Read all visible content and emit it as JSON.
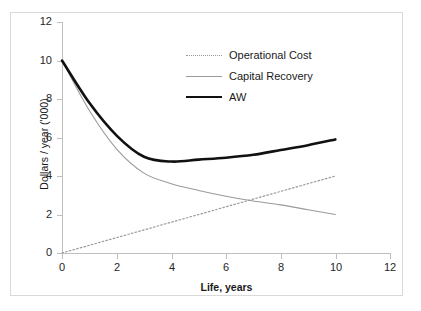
{
  "chart_data": {
    "type": "line",
    "title": "",
    "xlabel": "Life, years",
    "ylabel": "Dollars / year ('000)",
    "xlim": [
      0,
      12
    ],
    "ylim": [
      0,
      12
    ],
    "xticks": [
      "0",
      "2",
      "4",
      "6",
      "8",
      "10",
      "12"
    ],
    "yticks": [
      "0",
      "2",
      "4",
      "6",
      "8",
      "10",
      "12"
    ],
    "grid": false,
    "legend_position": "upper-center",
    "x": [
      0,
      1,
      2,
      3,
      4,
      5,
      6,
      7,
      8,
      9,
      10
    ],
    "series": [
      {
        "name": "Operational Cost",
        "style": "dotted",
        "color": "#9a9a9a",
        "values": [
          0.0,
          0.4,
          0.8,
          1.2,
          1.6,
          2.0,
          2.4,
          2.8,
          3.2,
          3.6,
          4.0
        ]
      },
      {
        "name": "Capital Recovery",
        "style": "thin",
        "color": "#9a9a9a",
        "values": [
          10.0,
          7.4,
          5.4,
          4.15,
          3.6,
          3.25,
          2.95,
          2.7,
          2.5,
          2.25,
          2.0
        ]
      },
      {
        "name": "AW",
        "style": "thick",
        "color": "#111111",
        "values": [
          10.0,
          7.8,
          6.1,
          5.0,
          4.75,
          4.85,
          4.95,
          5.1,
          5.35,
          5.6,
          5.9
        ]
      }
    ]
  },
  "legend": {
    "items": [
      {
        "label": "Operational Cost"
      },
      {
        "label": "Capital Recovery"
      },
      {
        "label": "AW"
      }
    ]
  },
  "axes": {
    "x_title": "Life, years",
    "y_title": "Dollars / year ('000)",
    "x_tick_labels": [
      "0",
      "2",
      "4",
      "6",
      "8",
      "10",
      "12"
    ],
    "y_tick_labels": [
      "0",
      "2",
      "4",
      "6",
      "8",
      "10",
      "12"
    ]
  },
  "colors": {
    "axis": "#bfbfbf",
    "frame": "#d9d9d9",
    "series_gray": "#9a9a9a",
    "series_black": "#111111",
    "text": "#1a1a1a",
    "background": "#ffffff"
  }
}
